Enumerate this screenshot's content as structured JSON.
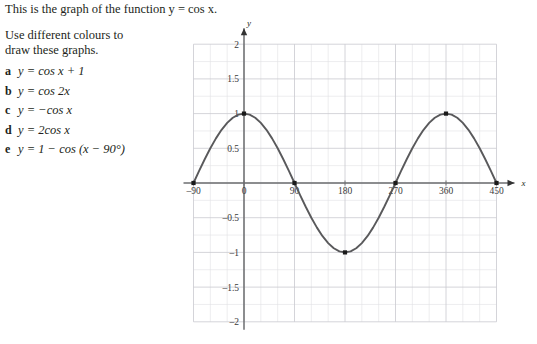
{
  "intro": {
    "line": "This is the graph of the function y = cos x."
  },
  "instruction": {
    "line1": "Use different colours to",
    "line2": "draw these graphs."
  },
  "equations": [
    {
      "marker": "a",
      "text": "y = cos x + 1"
    },
    {
      "marker": "b",
      "text": "y = cos 2x"
    },
    {
      "marker": "c",
      "text": "y = −cos x"
    },
    {
      "marker": "d",
      "text": "y = 2cos x"
    },
    {
      "marker": "e",
      "text": "y = 1 − cos (x − 90°)"
    }
  ],
  "graph": {
    "x_axis_label": "x",
    "y_axis_label": "y",
    "x_tick_labels": [
      "–90",
      "0",
      "90",
      "180",
      "270",
      "360",
      "450"
    ],
    "y_tick_labels": [
      "2",
      "1.5",
      "1",
      "0.5",
      "–0.5",
      "–1",
      "–1.5",
      "–2"
    ],
    "curve_color": "#59595b",
    "grid_color": "#d8d8dc",
    "axis_color": "#6d6e71",
    "point_color": "#1a1a1a"
  },
  "chart_data": {
    "type": "line",
    "title": "",
    "xlabel": "x",
    "ylabel": "y",
    "function": "y = cos x",
    "xlim": [
      -90,
      450
    ],
    "ylim": [
      -2,
      2
    ],
    "xticks": [
      -90,
      0,
      90,
      180,
      270,
      360,
      450
    ],
    "yticks": [
      2,
      1.5,
      1,
      0.5,
      0,
      -0.5,
      -1,
      -1.5,
      -2
    ],
    "xtick_labels": [
      "–90",
      "0",
      "90",
      "180",
      "270",
      "360",
      "450"
    ],
    "ytick_labels": [
      "2",
      "1.5",
      "1",
      "0.5",
      "0",
      "–0.5",
      "–1",
      "–1.5",
      "–2"
    ],
    "grid": true,
    "grid_minor_step_x": 30,
    "grid_minor_step_y": 0.25,
    "legend": false,
    "series": [
      {
        "name": "y = cos x",
        "x": [
          -90,
          -80,
          -70,
          -60,
          -50,
          -40,
          -30,
          -20,
          -10,
          0,
          10,
          20,
          30,
          40,
          50,
          60,
          70,
          80,
          90,
          100,
          110,
          120,
          130,
          140,
          150,
          160,
          170,
          180,
          190,
          200,
          210,
          220,
          230,
          240,
          250,
          260,
          270,
          280,
          290,
          300,
          310,
          320,
          330,
          340,
          350,
          360,
          370,
          380,
          390,
          400,
          410,
          420,
          430,
          440,
          450
        ],
        "y": [
          0,
          0.174,
          0.342,
          0.5,
          0.643,
          0.766,
          0.866,
          0.94,
          0.985,
          1,
          0.985,
          0.94,
          0.866,
          0.766,
          0.643,
          0.5,
          0.342,
          0.174,
          0,
          -0.174,
          -0.342,
          -0.5,
          -0.643,
          -0.766,
          -0.866,
          -0.94,
          -0.985,
          -1,
          -0.985,
          -0.94,
          -0.866,
          -0.766,
          -0.643,
          -0.5,
          -0.342,
          -0.174,
          0,
          0.174,
          0.342,
          0.5,
          0.643,
          0.766,
          0.866,
          0.94,
          0.985,
          1,
          0.985,
          0.94,
          0.866,
          0.766,
          0.643,
          0.5,
          0.342,
          0.174,
          0
        ]
      }
    ],
    "marked_points": [
      {
        "x": -90,
        "y": 0
      },
      {
        "x": 0,
        "y": 1
      },
      {
        "x": 90,
        "y": 0
      },
      {
        "x": 180,
        "y": -1
      },
      {
        "x": 270,
        "y": 0
      },
      {
        "x": 360,
        "y": 1
      },
      {
        "x": 450,
        "y": 0
      }
    ]
  }
}
